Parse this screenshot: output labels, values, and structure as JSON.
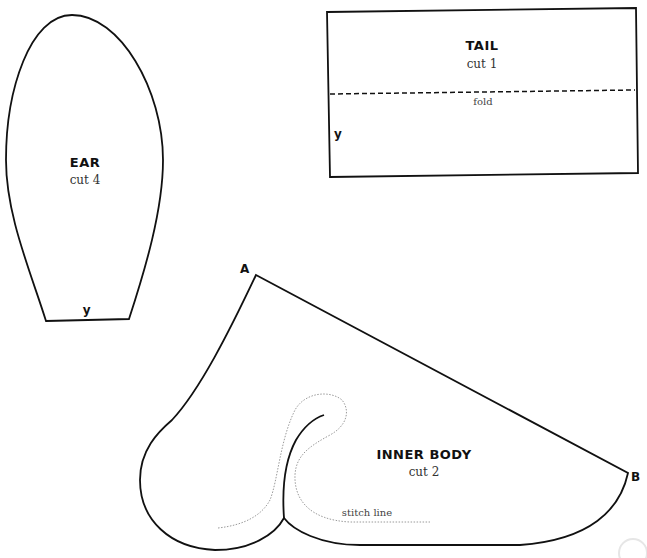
{
  "pieces": {
    "ear": {
      "title": "EAR",
      "cut": "cut 4",
      "mark": "y"
    },
    "tail": {
      "title": "TAIL",
      "cut": "cut 1",
      "fold_label": "fold",
      "mark": "y"
    },
    "inner_body": {
      "title": "INNER BODY",
      "cut": "cut 2",
      "stitch_label": "stitch line",
      "point_a": "A",
      "point_b": "B"
    }
  },
  "colors": {
    "outline": "#111111",
    "stitch": "#9a9a9a",
    "background": "#ffffff"
  }
}
